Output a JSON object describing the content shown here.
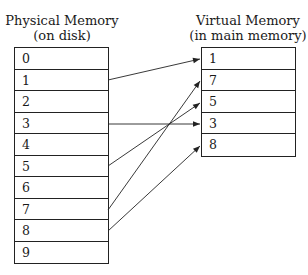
{
  "physical": {
    "title_line1": "Physical Memory",
    "title_line2": "(on disk)",
    "cells": [
      "0",
      "1",
      "2",
      "3",
      "4",
      "5",
      "6",
      "7",
      "8",
      "9"
    ]
  },
  "virtual": {
    "title_line1": "Virtual Memory",
    "title_line2": "(in main memory)",
    "cells": [
      "1",
      "7",
      "5",
      "3",
      "8"
    ]
  },
  "mappings": [
    {
      "from_physical": "1",
      "to_virtual_row": 0
    },
    {
      "from_physical": "3",
      "to_virtual_row": 3
    },
    {
      "from_physical": "5",
      "to_virtual_row": 2
    },
    {
      "from_physical": "7",
      "to_virtual_row": 1
    },
    {
      "from_physical": "8",
      "to_virtual_row": 4
    }
  ],
  "colors": {
    "line": "#222222",
    "background": "#ffffff"
  }
}
